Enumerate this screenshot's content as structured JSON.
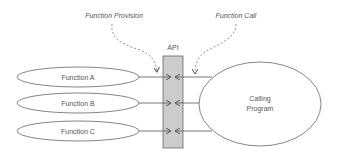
{
  "diagram": {
    "annotations": {
      "provision": "Function Provision",
      "call": "Function Call"
    },
    "api": {
      "label": "API"
    },
    "functions": [
      {
        "label": "Function A"
      },
      {
        "label": "Function B"
      },
      {
        "label": "Function C"
      }
    ],
    "caller": {
      "line1": "Calling",
      "line2": "Program"
    },
    "colors": {
      "stroke": "#555555",
      "api_fill": "#cccccc",
      "background": "#ffffff"
    }
  }
}
